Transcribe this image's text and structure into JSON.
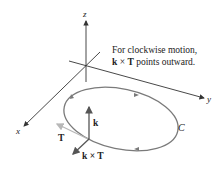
{
  "figure": {
    "axes": {
      "x_label": "x",
      "y_label": "y",
      "z_label": "z"
    },
    "curve_label": "C",
    "vectors": {
      "k_label": "k",
      "T_label": "T",
      "kxT_label": "k × T"
    },
    "caption": {
      "line1": "For clockwise motion,",
      "line2_bold_k": "k",
      "line2_times": " × ",
      "line2_bold_T": "T",
      "line2_rest": " points outward."
    },
    "colors": {
      "axis": "#333333",
      "curve": "#7a7a7a",
      "vector": "#555555",
      "tangent": "#b8b8b8"
    }
  }
}
